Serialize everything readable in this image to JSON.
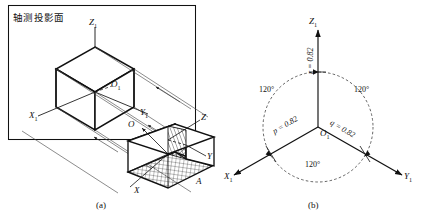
{
  "figure": {
    "title_note": "轴测投影面",
    "panels": [
      {
        "caption": "(a)",
        "name": "isometric-projection-setup"
      },
      {
        "caption": "(b)",
        "name": "isometric-axes-diagram"
      }
    ]
  },
  "panel_a": {
    "plane_label": "轴测投影面",
    "caption": "(a)",
    "projected_axes": [
      {
        "id": "z1",
        "label": "Z",
        "sub": "1"
      },
      {
        "id": "x1",
        "label": "X",
        "sub": "1"
      },
      {
        "id": "y1",
        "label": "Y",
        "sub": "1"
      },
      {
        "id": "o1",
        "label": "O",
        "sub": "1"
      }
    ],
    "object_axes": [
      {
        "id": "z",
        "label": "Z",
        "sub": ""
      },
      {
        "id": "x",
        "label": "X",
        "sub": ""
      },
      {
        "id": "y",
        "label": "Y",
        "sub": ""
      },
      {
        "id": "o",
        "label": "O",
        "sub": ""
      },
      {
        "id": "a",
        "label": "A",
        "sub": ""
      }
    ]
  },
  "panel_b": {
    "caption": "(b)",
    "origin": {
      "label": "O",
      "sub": "1"
    },
    "axes": [
      {
        "id": "z1",
        "label": "Z",
        "sub": "1",
        "direction": "up",
        "angle_deg": 90
      },
      {
        "id": "x1",
        "label": "X",
        "sub": "1",
        "direction": "down-left",
        "angle_deg": 210
      },
      {
        "id": "y1",
        "label": "Y",
        "sub": "1",
        "direction": "down-right",
        "angle_deg": 330
      }
    ],
    "angles": [
      {
        "id": "angle-left",
        "value": "120°"
      },
      {
        "id": "angle-right",
        "value": "120°"
      },
      {
        "id": "angle-bottom",
        "value": "120°"
      }
    ],
    "coefficients": [
      {
        "id": "r",
        "text": "r = 0.82",
        "symbol": "r",
        "value": "0.82",
        "axis": "z1"
      },
      {
        "id": "p",
        "text": "p = 0.82",
        "symbol": "p",
        "value": "0.82",
        "axis": "x1"
      },
      {
        "id": "q",
        "text": "q = 0.82",
        "symbol": "q",
        "value": "0.82",
        "axis": "y1"
      }
    ]
  },
  "colors": {
    "ink": "#111111",
    "line": "#1a1a1a",
    "thin": "#555555",
    "background": "#ffffff"
  }
}
